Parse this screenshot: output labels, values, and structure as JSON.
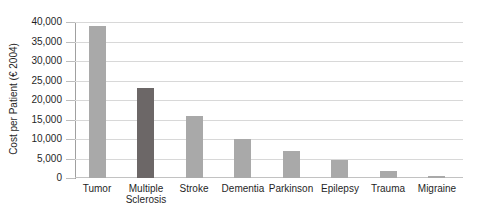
{
  "figure": {
    "background": "#ffffff"
  },
  "chart_data": {
    "type": "bar",
    "title": "",
    "ylabel": "Cost per Patient (€ 2004)",
    "xlabel": "",
    "categories": [
      "Tumor",
      "Multiple Sclerosis",
      "Stroke",
      "Dementia",
      "Parkinson",
      "Epilepsy",
      "Trauma",
      "Migraine"
    ],
    "values": [
      39000,
      23000,
      16000,
      10000,
      7000,
      4700,
      1800,
      600
    ],
    "ylim": [
      0,
      40000
    ],
    "ytick_step": 5000,
    "ytick_labels": [
      "0",
      "5,000",
      "10,000",
      "15,000",
      "20,000",
      "25,000",
      "30,000",
      "35,000",
      "40,000"
    ],
    "grid": true,
    "legend_position": "none",
    "bar_colors": [
      "#a9a9a9",
      "#6c6767",
      "#a9a9a9",
      "#a9a9a9",
      "#a9a9a9",
      "#a9a9a9",
      "#a9a9a9",
      "#a9a9a9"
    ],
    "colors": {
      "bar_default": "#a9a9a9",
      "bar_highlight": "#6c6767",
      "highlight_category": "Multiple Sclerosis",
      "gridline": "#d8d8d8",
      "baseline": "#c2c2c2",
      "axis_line": "#a0a0a0",
      "tick_mark": "#bdbdbd",
      "text": "#1f1f1f"
    }
  }
}
